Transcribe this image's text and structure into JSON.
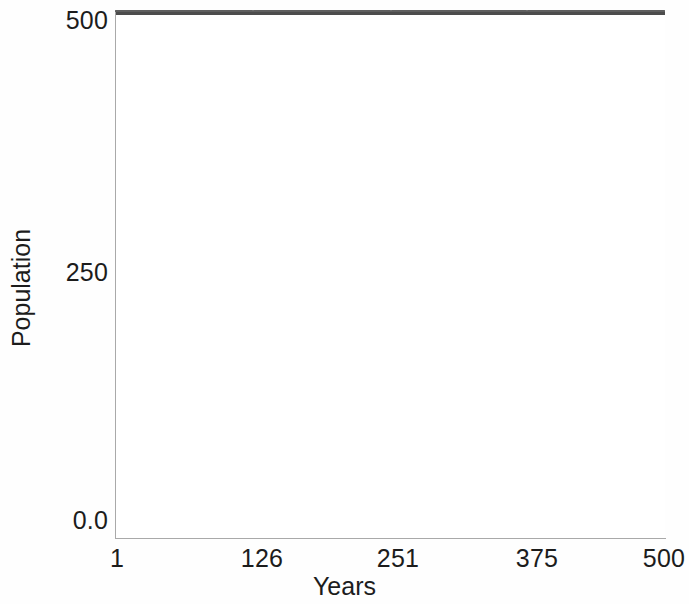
{
  "figure": {
    "background_color": "#ffffff",
    "width": 689,
    "height": 604
  },
  "chart_data": {
    "type": "line",
    "title": "",
    "subtitle": "",
    "xlabel": "Years",
    "ylabel": "Population",
    "xlim": [
      1,
      500
    ],
    "ylim": [
      0.0,
      500
    ],
    "grid": false,
    "legend": null,
    "annotations": [],
    "xtick_labels": [
      "1",
      "126",
      "251",
      "375",
      "500"
    ],
    "xtick_values": [
      1,
      126,
      251,
      375,
      500
    ],
    "ytick_labels": [
      "0.0",
      "250",
      "500"
    ],
    "ytick_values": [
      0.0,
      250,
      500
    ],
    "series": [
      {
        "name": "Population",
        "color": "#4c4c4c",
        "line_width": 5,
        "style": "solid",
        "description": "Constant population held at carrying capacity of 500 across all 500 years",
        "x": [
          1,
          126,
          251,
          375,
          500
        ],
        "values": [
          500,
          500,
          500,
          500,
          500
        ]
      }
    ]
  },
  "axes": {
    "spine_color": "#a9a9a9",
    "spines_visible": [
      "left",
      "bottom"
    ],
    "tick_marks_visible": false
  }
}
